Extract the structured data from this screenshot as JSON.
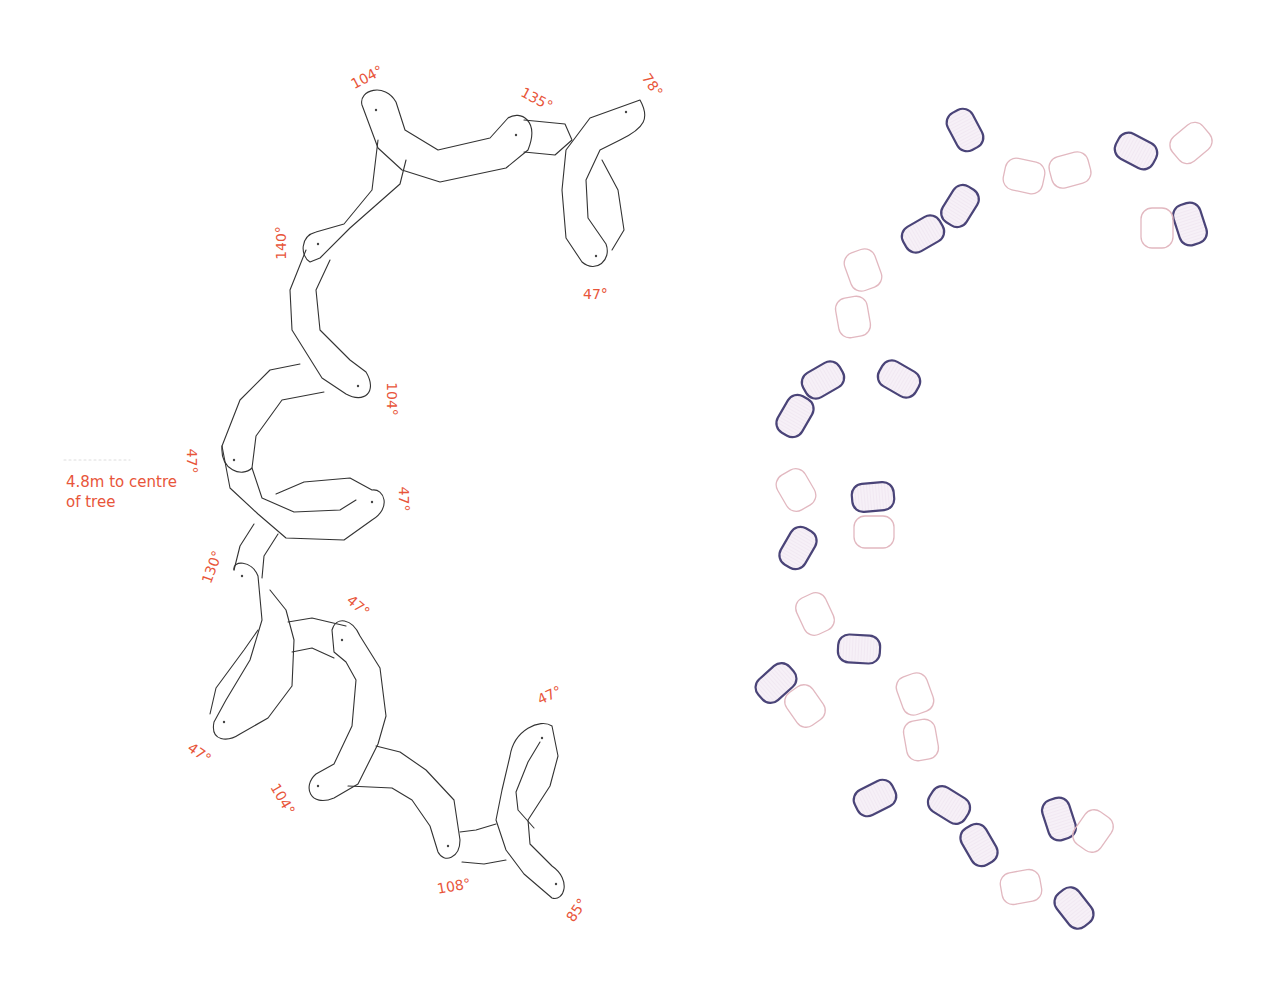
{
  "annotation": {
    "line1": "4.8m to centre",
    "line2": "of tree"
  },
  "colors": {
    "annotation": "#e8553a",
    "bench_outline": "#333333",
    "dark_block": "#4a4478",
    "light_block": "#e2b8c0"
  },
  "angles": [
    {
      "id": "a1",
      "text": "104°",
      "x": 368,
      "y": 78,
      "rot": -28
    },
    {
      "id": "a2",
      "text": "135°",
      "x": 538,
      "y": 100,
      "rot": 28
    },
    {
      "id": "a3",
      "text": "78°",
      "x": 658,
      "y": 86,
      "rot": 55
    },
    {
      "id": "a4",
      "text": "140°",
      "x": 282,
      "y": 244,
      "rot": -90
    },
    {
      "id": "a5",
      "text": "47°",
      "x": 601,
      "y": 295,
      "rot": 0
    },
    {
      "id": "a6",
      "text": "104°",
      "x": 393,
      "y": 400,
      "rot": 90
    },
    {
      "id": "a7",
      "text": "47°",
      "x": 198,
      "y": 462,
      "rot": 90
    },
    {
      "id": "a8",
      "text": "47°",
      "x": 410,
      "y": 500,
      "rot": 90
    },
    {
      "id": "a9",
      "text": "130°",
      "x": 213,
      "y": 568,
      "rot": -70
    },
    {
      "id": "a10",
      "text": "47°",
      "x": 364,
      "y": 607,
      "rot": 40
    },
    {
      "id": "a11",
      "text": "47°",
      "x": 205,
      "y": 754,
      "rot": 35
    },
    {
      "id": "a12",
      "text": "104°",
      "x": 284,
      "y": 800,
      "rot": 60
    },
    {
      "id": "a13",
      "text": "47°",
      "x": 555,
      "y": 696,
      "rot": -25
    },
    {
      "id": "a14",
      "text": "108°",
      "x": 455,
      "y": 887,
      "rot": -10
    },
    {
      "id": "a15",
      "text": "85°",
      "x": 582,
      "y": 911,
      "rot": -55
    }
  ],
  "bench_layout": {
    "pivots": [
      [
        376,
        110
      ],
      [
        516,
        135
      ],
      [
        626,
        112
      ],
      [
        596,
        256
      ],
      [
        318,
        244
      ],
      [
        358,
        386
      ],
      [
        234,
        460
      ],
      [
        372,
        502
      ],
      [
        242,
        576
      ],
      [
        342,
        640
      ],
      [
        224,
        722
      ],
      [
        318,
        786
      ],
      [
        448,
        846
      ],
      [
        542,
        738
      ],
      [
        556,
        884
      ]
    ]
  },
  "block_layout": {
    "dark": [
      {
        "x": 965,
        "y": 130,
        "rot": 62
      },
      {
        "x": 960,
        "y": 206,
        "rot": -58
      },
      {
        "x": 923,
        "y": 234,
        "rot": -30
      },
      {
        "x": 1136,
        "y": 151,
        "rot": 28
      },
      {
        "x": 1190,
        "y": 224,
        "rot": 72
      },
      {
        "x": 823,
        "y": 380,
        "rot": -30
      },
      {
        "x": 899,
        "y": 379,
        "rot": 30
      },
      {
        "x": 795,
        "y": 416,
        "rot": -60
      },
      {
        "x": 873,
        "y": 497,
        "rot": -5
      },
      {
        "x": 798,
        "y": 548,
        "rot": -60
      },
      {
        "x": 859,
        "y": 649,
        "rot": 3
      },
      {
        "x": 776,
        "y": 683,
        "rot": -42
      },
      {
        "x": 875,
        "y": 798,
        "rot": -27
      },
      {
        "x": 949,
        "y": 805,
        "rot": 32
      },
      {
        "x": 979,
        "y": 845,
        "rot": 60
      },
      {
        "x": 1059,
        "y": 819,
        "rot": 72
      },
      {
        "x": 1074,
        "y": 908,
        "rot": 52
      }
    ],
    "light": [
      {
        "x": 1024,
        "y": 176,
        "rot": 12
      },
      {
        "x": 1070,
        "y": 170,
        "rot": -15
      },
      {
        "x": 1191,
        "y": 143,
        "rot": -40
      },
      {
        "x": 1157,
        "y": 228,
        "rot": 90
      },
      {
        "x": 863,
        "y": 270,
        "rot": 70
      },
      {
        "x": 853,
        "y": 317,
        "rot": 80
      },
      {
        "x": 796,
        "y": 490,
        "rot": 60
      },
      {
        "x": 874,
        "y": 532,
        "rot": 0
      },
      {
        "x": 815,
        "y": 614,
        "rot": 65
      },
      {
        "x": 805,
        "y": 706,
        "rot": 55
      },
      {
        "x": 915,
        "y": 694,
        "rot": 70
      },
      {
        "x": 921,
        "y": 740,
        "rot": 80
      },
      {
        "x": 1093,
        "y": 831,
        "rot": -55
      },
      {
        "x": 1021,
        "y": 887,
        "rot": -10
      }
    ]
  }
}
